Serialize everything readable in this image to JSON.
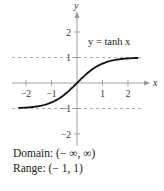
{
  "chart_data": {
    "type": "line",
    "title": "",
    "function_label": "y = tanh x",
    "xlabel": "x",
    "ylabel": "y",
    "xlim": [
      -2.3,
      2.4
    ],
    "ylim": [
      -2.1,
      2.7
    ],
    "x_ticks": [
      -2,
      -1,
      1,
      2
    ],
    "y_ticks": [
      -2,
      -1,
      1,
      2
    ],
    "x_tick_labels": [
      "−2",
      "−1",
      "1",
      "2"
    ],
    "y_tick_labels": [
      "−2",
      "−1",
      "1",
      "2"
    ],
    "asymptotes": [
      {
        "y": 1,
        "style": "dashed"
      },
      {
        "y": -1,
        "style": "dashed"
      }
    ],
    "series": [
      {
        "name": "y = tanh x",
        "x": [
          -2.3,
          -2,
          -1.5,
          -1,
          -0.5,
          0,
          0.5,
          1,
          1.5,
          2,
          2.4
        ],
        "values": [
          -0.98,
          -0.964,
          -0.905,
          -0.762,
          -0.462,
          0,
          0.462,
          0.762,
          0.905,
          0.964,
          0.984
        ]
      }
    ],
    "grid": false
  },
  "captions": {
    "domain": "Domain: (− ∞, ∞)",
    "range": "Range: (− 1, 1)"
  }
}
